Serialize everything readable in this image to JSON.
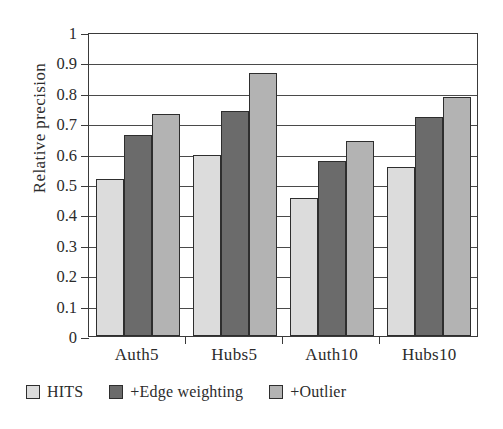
{
  "chart_data": {
    "type": "bar",
    "title": "",
    "xlabel": "",
    "ylabel": "Relative precision",
    "categories": [
      "Auth5",
      "Hubs5",
      "Auth10",
      "Hubs10"
    ],
    "series": [
      {
        "name": "HITS",
        "color": "#dcdcdc",
        "values": [
          0.515,
          0.595,
          0.455,
          0.555
        ]
      },
      {
        "name": "+Edge weighting",
        "color": "#6b6b6b",
        "values": [
          0.66,
          0.74,
          0.575,
          0.72
        ]
      },
      {
        "name": "+Outlier",
        "color": "#b3b3b3",
        "values": [
          0.73,
          0.865,
          0.64,
          0.785
        ]
      }
    ],
    "ylim": [
      0,
      1
    ],
    "ytick_labels": [
      "0",
      "0.1",
      "0.2",
      "0.3",
      "0.4",
      "0.5",
      "0.6",
      "0.7",
      "0.8",
      "0.9",
      "1"
    ],
    "ytick_values": [
      0,
      0.1,
      0.2,
      0.3,
      0.4,
      0.5,
      0.6,
      0.7,
      0.8,
      0.9,
      1
    ],
    "grid": true,
    "legend_position": "bottom-left",
    "legend": [
      "HITS",
      "+Edge weighting",
      "+Outlier"
    ]
  }
}
